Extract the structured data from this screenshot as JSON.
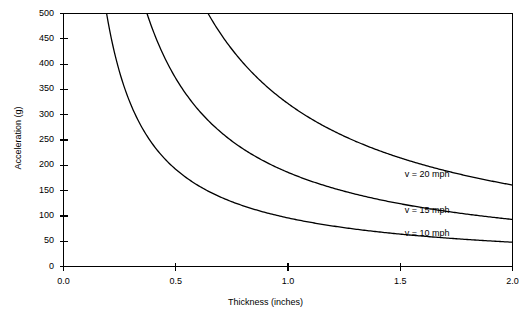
{
  "chart_data": {
    "type": "line",
    "title": "",
    "xlabel": "Thickness (inches)",
    "ylabel": "Acceleration (g)",
    "xlim": [
      0.0,
      2.0
    ],
    "ylim": [
      0,
      500
    ],
    "grid": false,
    "legend_position": "inline-right",
    "xticks": [
      "0.0",
      "0.5",
      "1.0",
      "1.5",
      "2.0"
    ],
    "xtick_values": [
      0.0,
      0.5,
      1.0,
      1.5,
      2.0
    ],
    "yticks": [
      "0",
      "50",
      "100",
      "150",
      "200",
      "250",
      "300",
      "350",
      "400",
      "450",
      "500"
    ],
    "ytick_values": [
      0,
      50,
      100,
      150,
      200,
      250,
      300,
      350,
      400,
      450,
      500
    ],
    "series": [
      {
        "name": "v = 10 mph",
        "coefficient": 96,
        "x": [
          0.19,
          0.25,
          0.3,
          0.4,
          0.5,
          0.6,
          0.7,
          0.8,
          0.9,
          1.0,
          1.1,
          1.2,
          1.3,
          1.4,
          1.5,
          1.6,
          1.7,
          1.8,
          1.9,
          2.0
        ],
        "values": [
          500,
          385,
          325,
          245,
          200,
          168,
          144,
          127,
          113,
          102,
          93,
          86,
          80,
          75,
          71,
          68,
          64,
          61,
          59,
          57
        ]
      },
      {
        "name": "v = 15 mph",
        "coefficient": 186,
        "x": [
          0.37,
          0.45,
          0.5,
          0.6,
          0.7,
          0.8,
          0.9,
          1.0,
          1.1,
          1.2,
          1.3,
          1.4,
          1.5,
          1.6,
          1.7,
          1.8,
          1.9,
          2.0
        ],
        "values": [
          500,
          415,
          374,
          313,
          268,
          235,
          209,
          188,
          171,
          157,
          145,
          134,
          126,
          118,
          111,
          105,
          99,
          94
        ]
      },
      {
        "name": "v = 20 mph",
        "coefficient": 322,
        "x": [
          0.64,
          0.7,
          0.8,
          0.9,
          1.0,
          1.1,
          1.2,
          1.3,
          1.4,
          1.5,
          1.6,
          1.7,
          1.8,
          1.9,
          2.0
        ],
        "values": [
          500,
          461,
          404,
          359,
          323,
          294,
          269,
          249,
          231,
          215,
          202,
          190,
          180,
          170,
          162
        ]
      }
    ],
    "series_label_positions": [
      {
        "label": "v = 10 mph",
        "x": 1.6,
        "y": 65
      },
      {
        "label": "v = 15 mph",
        "x": 1.6,
        "y": 110
      },
      {
        "label": "v = 20 mph",
        "x": 1.6,
        "y": 180
      }
    ],
    "colors": {
      "line": "#000000",
      "axis": "#000000",
      "background": "#ffffff"
    }
  }
}
